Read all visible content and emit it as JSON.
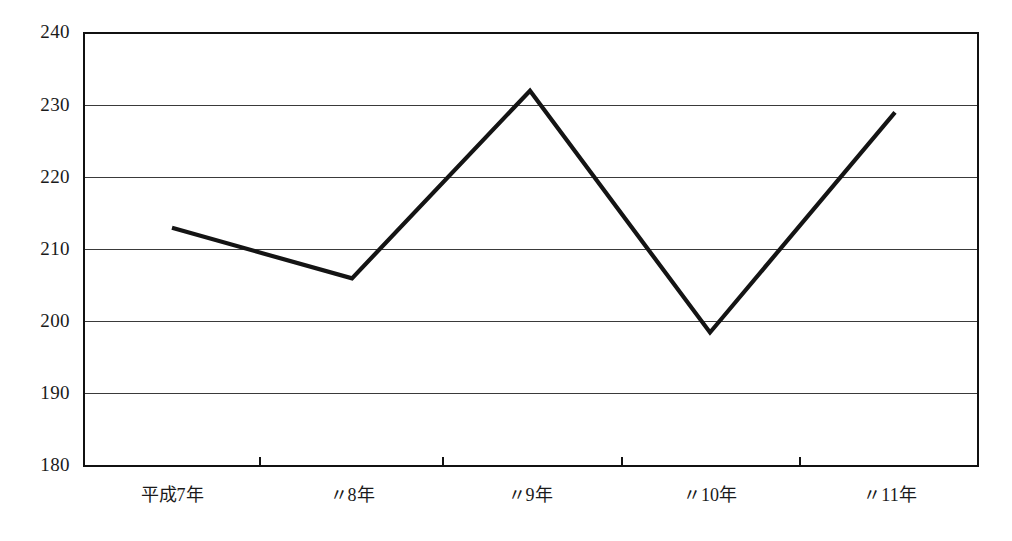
{
  "chart_data": {
    "type": "line",
    "title": "",
    "subtitle": "",
    "xlabel": "",
    "ylabel": "",
    "categories": [
      "平成7年",
      "〃8年",
      "〃9年",
      "〃10年",
      "〃11年"
    ],
    "series": [
      {
        "name": "",
        "values": [
          213,
          206,
          232,
          198.5,
          229
        ]
      }
    ],
    "ylim": [
      180,
      240
    ],
    "ytick_values": [
      180,
      190,
      200,
      210,
      220,
      230,
      240
    ],
    "ytick_labels": [
      "180",
      "190",
      "200",
      "210",
      "220",
      "230",
      "240"
    ],
    "ytick_step": 10,
    "xtick_labels": [
      "平成7年",
      "〃8年",
      "〃9年",
      "〃10年",
      "〃11年"
    ],
    "grid": true,
    "grid_axis": "y",
    "legend": false,
    "legend_position": "none",
    "line_color": "#141414",
    "grid_color": "#3a3a3a",
    "frame_color": "#111111",
    "background_color": "#ffffff"
  },
  "layout": {
    "plot_left": 84,
    "plot_right": 978,
    "plot_top": 33,
    "plot_bottom": 466,
    "xtick_positions": [
      260,
      443,
      622,
      800
    ],
    "label_positions": [
      172,
      352,
      530,
      710,
      890
    ],
    "label_baseline_y": 497,
    "point_x_positions": [
      172,
      352,
      530,
      710,
      895
    ]
  }
}
